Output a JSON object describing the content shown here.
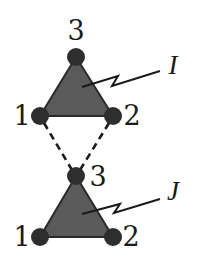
{
  "diagram": {
    "type": "graph",
    "colors": {
      "triangle_fill": "#5a5a5a",
      "triangle_stroke": "#2a2a2a",
      "node_fill": "#2e2e2e",
      "line": "#1a1a1a",
      "background": "#ffffff"
    },
    "triangles": [
      {
        "label": "I",
        "nodes": [
          {
            "id": "1",
            "label": "1",
            "x": 40,
            "y": 116
          },
          {
            "id": "2",
            "label": "2",
            "x": 113,
            "y": 116
          },
          {
            "id": "3",
            "label": "3",
            "x": 76,
            "y": 57
          }
        ]
      },
      {
        "label": "J",
        "nodes": [
          {
            "id": "1",
            "label": "1",
            "x": 40,
            "y": 237
          },
          {
            "id": "2",
            "label": "2",
            "x": 113,
            "y": 237
          },
          {
            "id": "3",
            "label": "3",
            "x": 76,
            "y": 176
          }
        ]
      }
    ],
    "dashed_edges": [
      {
        "from": "I.1",
        "to": "J.3"
      },
      {
        "from": "I.2",
        "to": "J.3"
      }
    ],
    "labels": {
      "I_node_1": "1",
      "I_node_2": "2",
      "I_node_3": "3",
      "I_name": "I",
      "J_node_1": "1",
      "J_node_2": "2",
      "J_node_3": "3",
      "J_name": "J"
    }
  }
}
